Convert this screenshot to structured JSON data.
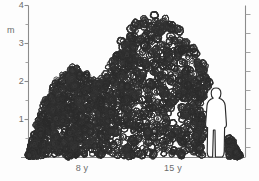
{
  "figure": {
    "unit_label": "m",
    "background_color": "#fdfdfd",
    "ink_color": "#3a3a3a",
    "axis_color": "#8c8c8c",
    "text_color": "#6b6b6b"
  },
  "chart_data": {
    "type": "area",
    "title": "",
    "subtitle": "",
    "xlabel": "",
    "ylabel": "m",
    "ylim": [
      0,
      4
    ],
    "grid": false,
    "legend": false,
    "y_ticks_major": [
      1,
      2,
      3,
      4
    ],
    "y_tick_labels": [
      "1",
      "2",
      "3",
      "4"
    ],
    "y_ticks_minor": [
      0.5,
      1.5,
      2.5,
      3.5
    ],
    "x_tick_labels": [
      "8 y",
      "15 y"
    ],
    "x_tick_label_positions_px": [
      82,
      173
    ],
    "right_axis": {
      "visible": true,
      "labels": [],
      "ticks": [
        0.25,
        0.5,
        0.75,
        1,
        1.25,
        1.5,
        1.75,
        2,
        2.25,
        2.5,
        2.75,
        3,
        3.25,
        3.5,
        3.75,
        4
      ]
    },
    "series": [
      {
        "name": "8 y canopy",
        "peak_height_m": 2.4,
        "x_extent_px": [
          28,
          118
        ],
        "values": [
          0.0,
          0.9,
          1.6,
          2.0,
          2.25,
          2.4,
          2.35,
          2.2,
          2.1,
          2.05,
          2.0
        ]
      },
      {
        "name": "15 y canopy",
        "peak_height_m": 3.8,
        "x_extent_px": [
          100,
          240
        ],
        "values": [
          2.0,
          2.6,
          3.1,
          3.5,
          3.75,
          3.8,
          3.7,
          3.5,
          3.2,
          2.8,
          2.2,
          1.5,
          0.6,
          0.0
        ]
      }
    ],
    "scale_figure": {
      "name": "human-silhouette",
      "height_m": 1.85,
      "x_center_px": 216
    }
  },
  "annotations": {
    "human_figure_caption": "",
    "notes": ""
  }
}
